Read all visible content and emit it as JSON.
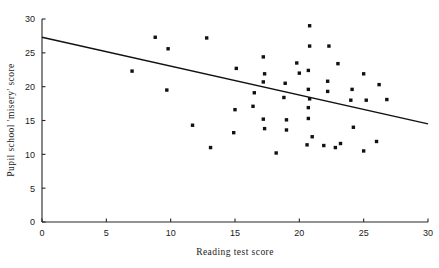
{
  "chart_data": {
    "type": "scatter",
    "title": "",
    "xlabel": "Reading test score",
    "ylabel": "Pupil school 'misery' score",
    "xlim": [
      0,
      30
    ],
    "ylim": [
      0,
      30
    ],
    "xticks": [
      0,
      5,
      10,
      15,
      20,
      25,
      30
    ],
    "yticks": [
      0,
      5,
      10,
      15,
      20,
      25,
      30
    ],
    "xtick_labels": [
      "0",
      "5",
      "10",
      "15",
      "20",
      "25",
      "30"
    ],
    "ytick_labels": [
      "0",
      "5",
      "10",
      "15",
      "20",
      "25",
      "30"
    ],
    "grid": false,
    "legend": false,
    "legend_position": "none",
    "point_color": "#111111",
    "line_color": "#111111",
    "axis_color": "#262626",
    "background_color": "#ffffff",
    "series": [
      {
        "name": "Pupils",
        "type": "scatter",
        "points": [
          [
            7.0,
            22.3
          ],
          [
            8.8,
            27.3
          ],
          [
            9.8,
            25.6
          ],
          [
            9.7,
            19.5
          ],
          [
            12.8,
            27.2
          ],
          [
            11.7,
            14.3
          ],
          [
            13.1,
            11.0
          ],
          [
            15.1,
            22.7
          ],
          [
            14.9,
            13.2
          ],
          [
            17.2,
            24.4
          ],
          [
            17.3,
            21.9
          ],
          [
            17.2,
            20.7
          ],
          [
            16.5,
            19.1
          ],
          [
            16.4,
            17.1
          ],
          [
            17.2,
            15.2
          ],
          [
            17.3,
            13.8
          ],
          [
            18.9,
            20.5
          ],
          [
            18.8,
            18.4
          ],
          [
            19.0,
            15.1
          ],
          [
            19.0,
            13.6
          ],
          [
            19.8,
            23.5
          ],
          [
            20.0,
            22.0
          ],
          [
            20.8,
            29.0
          ],
          [
            20.8,
            26.0
          ],
          [
            20.7,
            22.4
          ],
          [
            20.7,
            19.6
          ],
          [
            20.8,
            18.2
          ],
          [
            20.7,
            16.9
          ],
          [
            20.7,
            15.3
          ],
          [
            20.6,
            11.4
          ],
          [
            22.3,
            26.0
          ],
          [
            22.2,
            20.8
          ],
          [
            22.2,
            19.3
          ],
          [
            21.9,
            11.3
          ],
          [
            23.0,
            23.4
          ],
          [
            23.2,
            11.6
          ],
          [
            22.8,
            11.0
          ],
          [
            24.1,
            19.6
          ],
          [
            24.0,
            18.0
          ],
          [
            24.2,
            14.0
          ],
          [
            25.0,
            21.9
          ],
          [
            25.2,
            18.0
          ],
          [
            25.0,
            10.5
          ],
          [
            26.2,
            20.3
          ],
          [
            26.0,
            11.9
          ],
          [
            26.8,
            18.1
          ],
          [
            21.0,
            12.6
          ],
          [
            18.2,
            10.2
          ],
          [
            15.0,
            16.6
          ]
        ]
      },
      {
        "name": "Regression line",
        "type": "line",
        "points": [
          [
            0,
            27.3
          ],
          [
            30,
            14.5
          ]
        ]
      }
    ]
  }
}
